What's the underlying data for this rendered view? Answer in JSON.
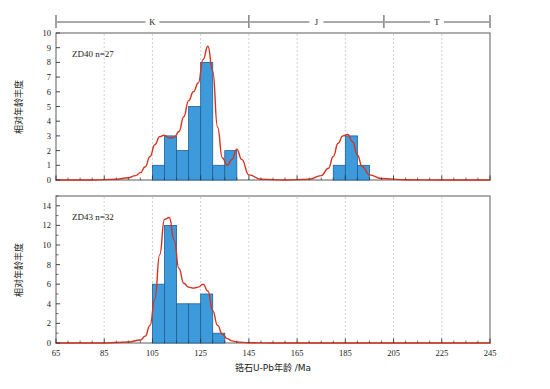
{
  "figure": {
    "x_axis_title": "锆石U-Pb年龄 /Ma",
    "y_axis_title": "相对年龄丰度",
    "x_tick_labels": [
      "65",
      "85",
      "105",
      "125",
      "145",
      "165",
      "185",
      "205",
      "225",
      "245"
    ],
    "x_ticks": [
      65,
      85,
      105,
      125,
      145,
      165,
      185,
      205,
      225,
      245
    ],
    "xlim": [
      65,
      245
    ],
    "period_bar": {
      "segments": [
        {
          "label": "K",
          "start": 65,
          "end": 145
        },
        {
          "label": "J",
          "start": 145,
          "end": 201
        },
        {
          "label": "T",
          "start": 201,
          "end": 245
        }
      ]
    }
  },
  "panels": [
    {
      "id": "zd40",
      "sample_label": "ZD40 n=27",
      "sample_name": "ZD40",
      "sample_n": "n=27",
      "y_tick_labels": [
        "0",
        "1",
        "2",
        "3",
        "4",
        "5",
        "6",
        "7",
        "8",
        "9",
        "10"
      ],
      "ylim": [
        0,
        10
      ]
    },
    {
      "id": "zd43",
      "sample_label": "ZD43 n=32",
      "sample_name": "ZD43",
      "sample_n": "n=32",
      "y_tick_labels": [
        "0",
        "2",
        "4",
        "6",
        "8",
        "10",
        "12",
        "14"
      ],
      "ylim": [
        0,
        15
      ]
    }
  ],
  "colors": {
    "bar_fill": "#3d9bdc",
    "bar_stroke": "#1f5f96",
    "curve": "#d4341f",
    "axis": "#555555",
    "grid": "#bfbfbf",
    "text": "#1a1a1a"
  },
  "chart_data": [
    {
      "type": "bar",
      "id": "zd40",
      "title": "ZD40 n=27",
      "xlabel": "锆石U-Pb年龄 /Ma",
      "ylabel": "相对年龄丰度",
      "xlim": [
        65,
        245
      ],
      "ylim": [
        0,
        10
      ],
      "grid": true,
      "bin_width": 5,
      "bin_starts": [
        105,
        110,
        115,
        120,
        125,
        130,
        135,
        180,
        185,
        190
      ],
      "values": [
        1,
        3,
        2,
        5,
        8,
        1,
        2,
        1,
        3,
        1
      ],
      "curve": {
        "name": "relative probability (KDE)",
        "x": [
          65,
          80,
          90,
          95,
          98,
          100,
          102,
          104,
          106,
          108,
          110,
          112,
          114,
          116,
          118,
          120,
          122,
          124,
          126,
          128,
          130,
          132,
          134,
          136,
          138,
          140,
          142,
          145,
          150,
          160,
          170,
          175,
          178,
          180,
          182,
          184,
          186,
          188,
          190,
          192,
          195,
          200,
          210,
          225,
          245
        ],
        "y": [
          0,
          0,
          0.05,
          0.15,
          0.3,
          0.5,
          0.9,
          1.6,
          2.4,
          2.95,
          3.05,
          2.85,
          2.9,
          3.3,
          4.3,
          5.4,
          6.0,
          6.6,
          8.2,
          9.1,
          7.4,
          3.6,
          1.5,
          1.0,
          1.4,
          2.1,
          1.4,
          0.35,
          0.05,
          0.0,
          0.05,
          0.3,
          0.8,
          1.6,
          2.5,
          3.0,
          3.1,
          2.6,
          1.7,
          0.9,
          0.35,
          0.1,
          0.02,
          0.0,
          0.0
        ]
      }
    },
    {
      "type": "bar",
      "id": "zd43",
      "title": "ZD43 n=32",
      "xlabel": "锆石U-Pb年龄 /Ma",
      "ylabel": "相对年龄丰度",
      "xlim": [
        65,
        245
      ],
      "ylim": [
        0,
        15
      ],
      "grid": true,
      "bin_width": 5,
      "bin_starts": [
        105,
        110,
        115,
        120,
        125,
        130
      ],
      "values": [
        6,
        12,
        4,
        4,
        5,
        1
      ],
      "curve": {
        "name": "relative probability (KDE)",
        "x": [
          65,
          85,
          95,
          100,
          102,
          104,
          106,
          108,
          110,
          112,
          114,
          116,
          118,
          120,
          122,
          124,
          126,
          128,
          130,
          132,
          134,
          136,
          138,
          140,
          145,
          155,
          165,
          185,
          205,
          225,
          245
        ],
        "y": [
          0,
          0,
          0.1,
          0.3,
          0.7,
          1.8,
          4.5,
          9.0,
          12.6,
          12.8,
          10.5,
          7.6,
          6.1,
          5.7,
          5.6,
          5.7,
          6.0,
          5.3,
          3.3,
          1.8,
          0.9,
          0.45,
          0.22,
          0.1,
          0.03,
          0.0,
          0.0,
          0.0,
          0.0,
          0.0,
          0.0
        ]
      }
    }
  ]
}
